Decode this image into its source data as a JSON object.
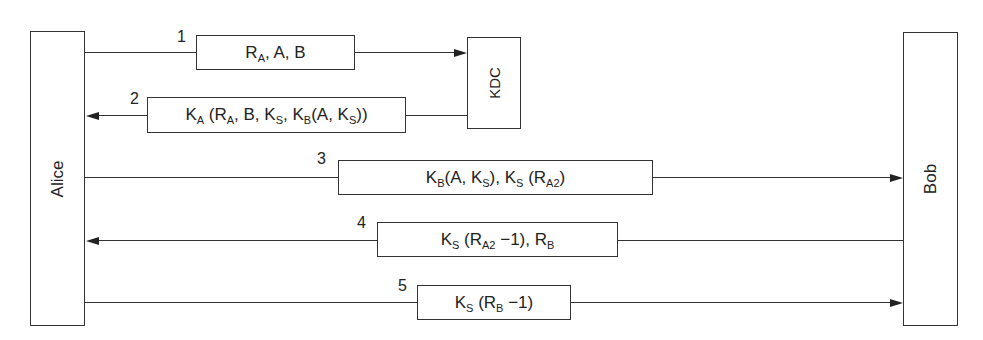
{
  "actors": {
    "alice": "Alice",
    "bob": "Bob",
    "kdc": "KDC"
  },
  "messages": [
    {
      "num": "1",
      "from": "Alice",
      "to": "KDC",
      "parts": [
        [
          "R",
          "A"
        ],
        [
          ", A, B",
          ""
        ]
      ]
    },
    {
      "num": "2",
      "from": "KDC",
      "to": "Alice",
      "parts": [
        [
          "K",
          "A"
        ],
        [
          " (R",
          "A"
        ],
        [
          ", B, K",
          "S"
        ],
        [
          ", K",
          "B"
        ],
        [
          "(A, K",
          "S"
        ],
        [
          "))",
          ""
        ]
      ]
    },
    {
      "num": "3",
      "from": "Alice",
      "to": "Bob",
      "parts": [
        [
          "K",
          "B"
        ],
        [
          "(A, K",
          "S"
        ],
        [
          "), K",
          "S"
        ],
        [
          " (R",
          "A2"
        ],
        [
          ")",
          ""
        ]
      ]
    },
    {
      "num": "4",
      "from": "Bob",
      "to": "Alice",
      "parts": [
        [
          "K",
          "S"
        ],
        [
          " (R",
          "A2"
        ],
        [
          " −1), R",
          "B"
        ]
      ]
    },
    {
      "num": "5",
      "from": "Alice",
      "to": "Bob",
      "parts": [
        [
          "K",
          "S"
        ],
        [
          " (R",
          "B"
        ],
        [
          " −1)",
          ""
        ]
      ]
    }
  ],
  "message_text": [
    "R_A, A, B",
    "K_A (R_A, B, K_S, K_B(A, K_S))",
    "K_B(A, K_S), K_S (R_A2)",
    "K_S (R_A2 −1), R_B",
    "K_S (R_B −1)"
  ]
}
